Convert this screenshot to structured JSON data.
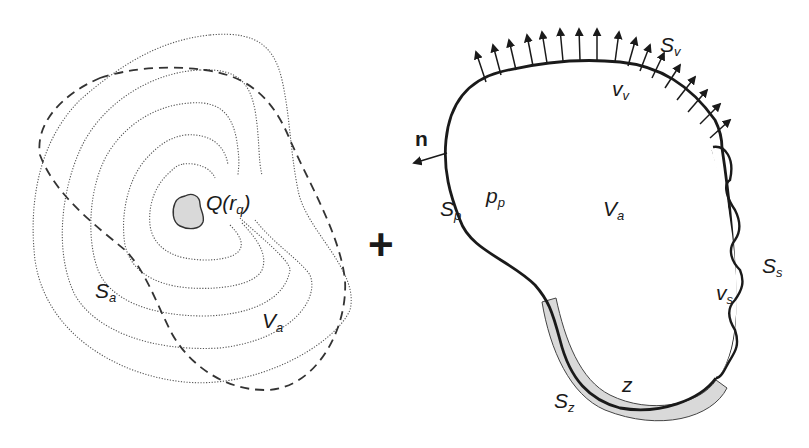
{
  "left_panel": {
    "source_label": "Q(r",
    "source_sub": "q",
    "source_close": ")",
    "surface_label": "S",
    "surface_sub": "a",
    "volume_label": "V",
    "volume_sub": "a",
    "description": "Point source Q radiating into volume V_a bounded by dashed surface S_a, with dotted wavefront contours"
  },
  "operator": "+",
  "right_panel": {
    "normal_label": "n",
    "velocity_surface_label": "S",
    "velocity_surface_sub": "v",
    "velocity_label": "v",
    "velocity_sub": "v",
    "pressure_surface_label": "S",
    "pressure_surface_sub": "p",
    "pressure_label": "p",
    "pressure_sub": "p",
    "volume_label": "V",
    "volume_sub": "a",
    "structure_surface_label": "S",
    "structure_surface_sub": "s",
    "structure_velocity_label": "v",
    "structure_velocity_sub": "s",
    "impedance_surface_label": "S",
    "impedance_surface_sub": "z",
    "impedance_label": "z",
    "velocity_arrow_count": 16
  },
  "colors": {
    "ink": "#1a1a1a",
    "contour": "#555555",
    "fill_gray": "#d9d9d9"
  }
}
